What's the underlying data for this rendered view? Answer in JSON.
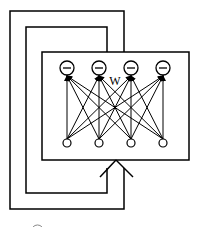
{
  "diagram": {
    "type": "recurrent neural network (Hopfield-style) with feedback loops",
    "weight_label": "W",
    "output_neurons": [
      {
        "id": "out-1",
        "symbol": "−"
      },
      {
        "id": "out-2",
        "symbol": "−"
      },
      {
        "id": "out-3",
        "symbol": "−"
      },
      {
        "id": "out-4",
        "symbol": "−"
      }
    ],
    "input_neurons": [
      {
        "id": "in-1"
      },
      {
        "id": "in-2"
      },
      {
        "id": "in-3"
      },
      {
        "id": "in-4"
      }
    ],
    "connections": "fully connected: each input neuron to each output neuron",
    "feedback_loops": 2,
    "colors": {
      "stroke": "#000000",
      "background": "#ffffff"
    }
  }
}
